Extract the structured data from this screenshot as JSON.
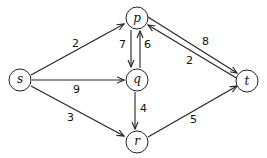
{
  "nodes": {
    "p": {
      "label": "p",
      "x": 137,
      "y": 18
    },
    "q": {
      "label": "q",
      "x": 137,
      "y": 80
    },
    "r": {
      "label": "r",
      "x": 137,
      "y": 142
    },
    "s": {
      "label": "s",
      "x": 20,
      "y": 80
    },
    "t": {
      "label": "t",
      "x": 247,
      "y": 81
    }
  },
  "edges": [
    {
      "from": "s",
      "to": "p",
      "weight": "2"
    },
    {
      "from": "s",
      "to": "q",
      "weight": "9"
    },
    {
      "from": "s",
      "to": "r",
      "weight": "3"
    },
    {
      "from": "p",
      "to": "q",
      "weight": "7"
    },
    {
      "from": "q",
      "to": "p",
      "weight": "6"
    },
    {
      "from": "q",
      "to": "r",
      "weight": "4"
    },
    {
      "from": "p",
      "to": "t",
      "weight": "8"
    },
    {
      "from": "t",
      "to": "p",
      "weight": "2"
    },
    {
      "from": "r",
      "to": "t",
      "weight": "5"
    }
  ]
}
